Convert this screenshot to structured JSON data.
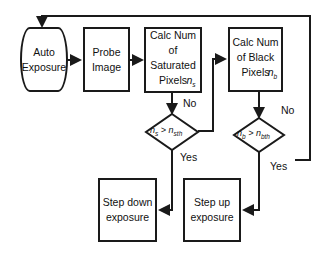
{
  "diagram": {
    "nodes": {
      "auto_exposure": "Auto Exposure",
      "probe_image": "Probe Image",
      "calc_saturated": {
        "text": "Calc Num of Saturated Pixels",
        "var": "n",
        "sub": "s"
      },
      "calc_black": {
        "text": "Calc Num of Black Pixels",
        "var": "n",
        "sub": "b"
      },
      "step_down": "Step down exposure",
      "step_up": "Step up exposure"
    },
    "decisions": {
      "saturated": {
        "lhs": "n",
        "lhs_sub": "s",
        "op": ">",
        "rhs": "n",
        "rhs_sub": "sth"
      },
      "black": {
        "lhs": "n",
        "lhs_sub": "b",
        "op": ">",
        "rhs": "n",
        "rhs_sub": "bth"
      }
    },
    "edge_labels": {
      "sat_no": "No",
      "sat_yes": "Yes",
      "black_no": "No",
      "black_yes": "Yes"
    }
  }
}
